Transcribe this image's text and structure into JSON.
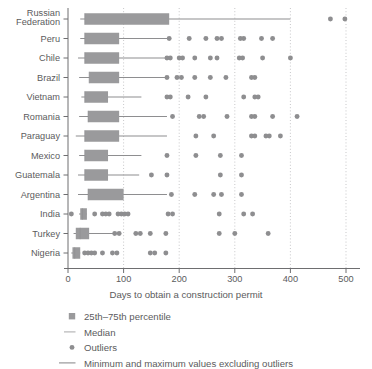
{
  "chart_data": {
    "type": "boxplot",
    "title": "",
    "xlabel": "Days to obtain a construction permit",
    "ylabel": "",
    "xlim": [
      0,
      520
    ],
    "xticks": [
      0,
      100,
      200,
      300,
      400,
      500
    ],
    "xtick_labels": [
      "0",
      "100",
      "200",
      "300",
      "400",
      "500"
    ],
    "grid": "vertical-dotted",
    "orientation": "horizontal",
    "legend_position": "below-axis-left",
    "categories": [
      "Russian Federation",
      "Peru",
      "Chile",
      "Brazil",
      "Vietnam",
      "Romania",
      "Paraguay",
      "Mexico",
      "Guatemala",
      "Argentina",
      "India",
      "Turkey",
      "Nigeria"
    ],
    "series": [
      {
        "name": "Russian Federation",
        "whisker_low": 22,
        "q1": 30,
        "median": 30,
        "q3": 182,
        "whisker_high": 400,
        "outliers": [
          472,
          498
        ]
      },
      {
        "name": "Peru",
        "whisker_low": 22,
        "q1": 30,
        "median": 30,
        "q3": 92,
        "whisker_high": 182,
        "outliers": [
          182,
          218,
          248,
          268,
          276,
          310,
          316,
          348,
          368
        ]
      },
      {
        "name": "Chile",
        "whisker_low": 18,
        "q1": 30,
        "median": 30,
        "q3": 92,
        "whisker_high": 178,
        "outliers": [
          178,
          184,
          200,
          206,
          228,
          256,
          268,
          308,
          314,
          350,
          400
        ]
      },
      {
        "name": "Brazil",
        "whisker_low": 20,
        "q1": 38,
        "median": 38,
        "q3": 92,
        "whisker_high": 178,
        "outliers": [
          178,
          196,
          204,
          228,
          256,
          284,
          330,
          336
        ]
      },
      {
        "name": "Vietnam",
        "whisker_low": 24,
        "q1": 30,
        "median": 30,
        "q3": 72,
        "whisker_high": 132,
        "outliers": [
          178,
          184,
          216,
          248,
          316,
          336,
          342
        ]
      },
      {
        "name": "Romania",
        "whisker_low": 20,
        "q1": 36,
        "median": 36,
        "q3": 92,
        "whisker_high": 178,
        "outliers": [
          188,
          236,
          244,
          286,
          330,
          336,
          368,
          412
        ]
      },
      {
        "name": "Paraguay",
        "whisker_low": 14,
        "q1": 30,
        "median": 30,
        "q3": 92,
        "whisker_high": 178,
        "outliers": [
          230,
          262,
          330,
          336,
          356,
          362,
          382
        ]
      },
      {
        "name": "Mexico",
        "whisker_low": 20,
        "q1": 30,
        "median": 30,
        "q3": 72,
        "whisker_high": 132,
        "outliers": [
          178,
          230,
          274,
          312
        ]
      },
      {
        "name": "Guatemala",
        "whisker_low": 18,
        "q1": 30,
        "median": 30,
        "q3": 72,
        "whisker_high": 128,
        "outliers": [
          150,
          178,
          274,
          312
        ]
      },
      {
        "name": "Argentina",
        "whisker_low": 18,
        "q1": 36,
        "median": 36,
        "q3": 100,
        "whisker_high": 178,
        "outliers": [
          186,
          228,
          262,
          276,
          312
        ]
      },
      {
        "name": "India",
        "whisker_low": 20,
        "q1": 22,
        "median": 26,
        "q3": 34,
        "whisker_high": 34,
        "outliers": [
          6,
          48,
          62,
          68,
          74,
          90,
          96,
          102,
          108,
          180,
          188,
          272,
          316,
          332
        ]
      },
      {
        "name": "Turkey",
        "whisker_low": 10,
        "q1": 14,
        "median": 22,
        "q3": 38,
        "whisker_high": 82,
        "outliers": [
          84,
          92,
          122,
          130,
          148,
          176,
          272,
          300,
          360
        ]
      },
      {
        "name": "Nigeria",
        "whisker_low": 6,
        "q1": 8,
        "median": 12,
        "q3": 22,
        "whisker_high": 22,
        "outliers": [
          30,
          36,
          42,
          48,
          62,
          80,
          88,
          148,
          156,
          176
        ]
      }
    ],
    "legend": [
      {
        "key": "box",
        "label": "25th–75th percentile"
      },
      {
        "key": "median",
        "label": "Median"
      },
      {
        "key": "outliers",
        "label": "Outliers"
      },
      {
        "key": "whisker",
        "label": "Minimum and maximum values excluding outliers"
      }
    ],
    "colors": {
      "box_fill": "#9a9a9c",
      "marker": "#8e8e90",
      "line": "#8e8e90",
      "axis": "#6e6e70",
      "grid": "#b9b9bb",
      "text": "#5b5b5d"
    }
  }
}
